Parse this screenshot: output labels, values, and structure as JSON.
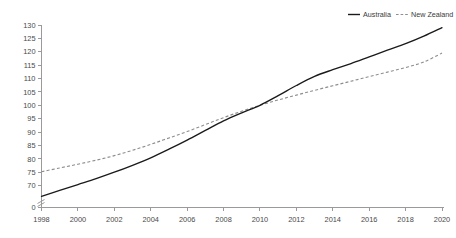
{
  "chart_data": {
    "type": "line",
    "title": "",
    "subtitle": "",
    "xlabel": "",
    "ylabel": "",
    "grid": false,
    "legend_position": "top-right",
    "axis_break": true,
    "xlim": [
      1998,
      2020
    ],
    "ylim": [
      65,
      130
    ],
    "y_zero_tick": "0",
    "x_tick_labels": [
      "1998",
      "2000",
      "2002",
      "2004",
      "2006",
      "2008",
      "2010",
      "2012",
      "2014",
      "2016",
      "2018",
      "2020"
    ],
    "x_tick_values": [
      1998,
      2000,
      2002,
      2004,
      2006,
      2008,
      2010,
      2012,
      2014,
      2016,
      2018,
      2020
    ],
    "y_tick_labels": [
      "130",
      "125",
      "120",
      "115",
      "110",
      "105",
      "100",
      "95",
      "90",
      "85",
      "80",
      "75",
      "70",
      "0"
    ],
    "y_tick_values": [
      130,
      125,
      120,
      115,
      110,
      105,
      100,
      95,
      90,
      85,
      80,
      75,
      70,
      0
    ],
    "x": [
      1998,
      1999,
      2000,
      2001,
      2002,
      2003,
      2004,
      2005,
      2006,
      2007,
      2008,
      2009,
      2010,
      2011,
      2012,
      2013,
      2014,
      2015,
      2016,
      2017,
      2018,
      2019,
      2020
    ],
    "series": [
      {
        "name": "Australia",
        "style": "solid",
        "color": "#1a1a1a",
        "values": [
          66.0,
          68.2,
          70.4,
          72.6,
          75.0,
          77.6,
          80.4,
          83.6,
          87.0,
          90.6,
          94.2,
          97.2,
          100.0,
          103.6,
          107.4,
          110.8,
          113.3,
          115.6,
          118.1,
          120.6,
          123.0,
          125.8,
          129.0
        ]
      },
      {
        "name": "New Zealand",
        "style": "dashed",
        "color": "#8d8d8d",
        "values": [
          75.2,
          76.6,
          78.0,
          79.5,
          81.2,
          83.2,
          85.4,
          87.8,
          90.2,
          92.8,
          95.4,
          97.8,
          100.0,
          102.0,
          103.8,
          105.6,
          107.3,
          109.0,
          110.7,
          112.4,
          114.1,
          116.2,
          119.5
        ]
      }
    ]
  },
  "legend": {
    "items": [
      {
        "label": "Australia"
      },
      {
        "label": "New Zealand"
      }
    ]
  }
}
